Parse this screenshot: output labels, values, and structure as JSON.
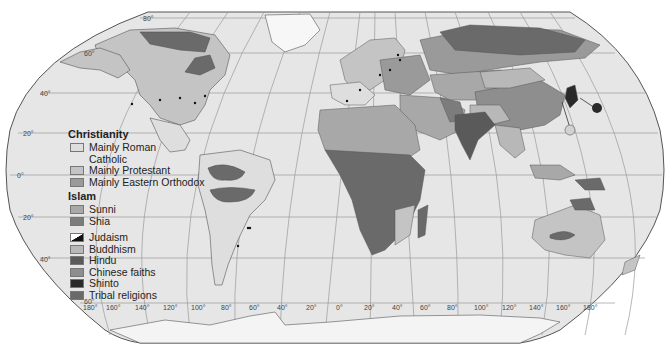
{
  "map": {
    "type": "world religions thematic map",
    "projection": "Robinson-style",
    "latitude_labels": {
      "left": [
        "80°",
        "60°",
        "40°",
        "20°",
        "0°",
        "20°",
        "40°",
        "60°"
      ],
      "l80": "80°",
      "l60": "60°",
      "l40": "40°",
      "l20n": "20°",
      "l0": "0°",
      "l20s": "20°",
      "l40s": "40°",
      "l60s": "60°"
    },
    "longitude_labels": {
      "w180": "180°",
      "w160": "160°",
      "w140": "140°",
      "w120": "120°",
      "w100": "100°",
      "w80": "80°",
      "w60": "60°",
      "w40": "40°",
      "w20": "20°",
      "zero": "0°",
      "e20": "20°",
      "e40": "40°",
      "e60": "60°",
      "e80": "80°",
      "e100": "100°",
      "e120": "120°",
      "e140": "140°",
      "e160": "160°",
      "e180": "180°"
    },
    "colors": {
      "ocean": "#e6e6e6",
      "roman_catholic": "#dedede",
      "protestant": "#c4c4c4",
      "eastern_orthodox": "#9a9a9a",
      "sunni": "#a8a8a8",
      "shia": "#7c7c7c",
      "buddhism": "#b8b8b8",
      "hindu": "#5a5a5a",
      "chinese_faiths": "#8e8e8e",
      "shinto": "#2a2a2a",
      "tribal": "#6a6a6a",
      "judaism": "#111111"
    }
  },
  "legend": {
    "christianity": {
      "heading": "Christianity",
      "items": [
        {
          "label": "Mainly Roman Catholic",
          "line1": "Mainly Roman",
          "line2": "Catholic",
          "color": "#dedede"
        },
        {
          "label": "Mainly Protestant",
          "color": "#c4c4c4"
        },
        {
          "label": "Mainly Eastern Orthodox",
          "color": "#9a9a9a"
        }
      ]
    },
    "islam": {
      "heading": "Islam",
      "items": [
        {
          "label": "Sunni",
          "color": "#a8a8a8"
        },
        {
          "label": "Shia",
          "color": "#7c7c7c"
        }
      ]
    },
    "other": [
      {
        "label": "Judaism",
        "color": "#111111"
      },
      {
        "label": "Buddhism",
        "color": "#b8b8b8"
      },
      {
        "label": "Hindu",
        "color": "#5a5a5a"
      },
      {
        "label": "Chinese faiths",
        "color": "#8e8e8e"
      },
      {
        "label": "Shinto",
        "color": "#2a2a2a"
      },
      {
        "label": "Tribal religions",
        "color": "#6a6a6a"
      }
    ]
  }
}
